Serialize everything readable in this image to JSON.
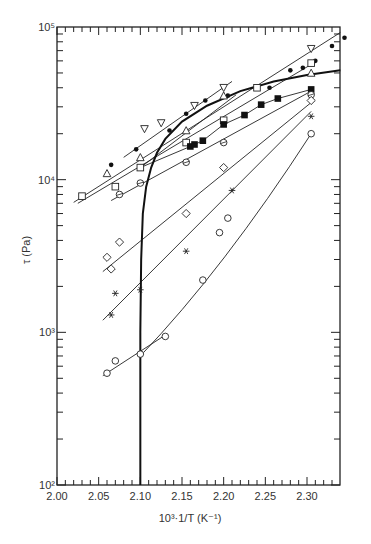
{
  "chart_data": {
    "type": "scatter",
    "title": "",
    "xlabel": "10³·1/T (K⁻¹)",
    "ylabel": "τ (Pa)",
    "xscale": "linear",
    "yscale": "log",
    "xlim": [
      2.0,
      2.34
    ],
    "ylim": [
      100,
      100000
    ],
    "grid": false,
    "legend": null,
    "x_ticks": [
      2.0,
      2.05,
      2.1,
      2.15,
      2.2,
      2.25,
      2.3
    ],
    "x_tick_labels": [
      "2.00",
      "2.05",
      "2.10",
      "2.15",
      "2.20",
      "2.25",
      "2.30"
    ],
    "y_ticks": [
      100,
      1000,
      10000,
      100000
    ],
    "y_tick_labels": [
      "10²",
      "10³",
      "10⁴",
      "10⁵"
    ],
    "envelope_curve": {
      "name": "bold boundary curve",
      "x": [
        2.1,
        2.1,
        2.101,
        2.103,
        2.107,
        2.113,
        2.12,
        2.13,
        2.15,
        2.18,
        2.22,
        2.26,
        2.3,
        2.34
      ],
      "y": [
        100,
        1000,
        3000,
        6000,
        9000,
        12000,
        15000,
        18500,
        24000,
        30500,
        38000,
        44000,
        48500,
        52000
      ]
    },
    "series": [
      {
        "name": "filled circle",
        "marker": "dot",
        "line": [
          [
            2.02,
            7100
          ],
          [
            2.34,
            92000
          ]
        ],
        "x": [
          2.065,
          2.095,
          2.135,
          2.155,
          2.178,
          2.205,
          2.255,
          2.28,
          2.295,
          2.31,
          2.33,
          2.345
        ],
        "y": [
          12500,
          15800,
          21000,
          27000,
          33000,
          35500,
          40000,
          52000,
          54000,
          60000,
          75000,
          85000
        ]
      },
      {
        "name": "inverted triangle",
        "marker": "tri-down",
        "line": [
          [
            2.08,
            14000
          ],
          [
            2.21,
            44000
          ]
        ],
        "x": [
          2.105,
          2.125,
          2.165,
          2.2,
          2.305
        ],
        "y": [
          21500,
          23500,
          30500,
          40000,
          72000
        ]
      },
      {
        "name": "open triangle",
        "marker": "tri-up",
        "line": [
          [
            2.1,
            12000
          ],
          [
            2.215,
            36000
          ]
        ],
        "x": [
          2.06,
          2.1,
          2.155,
          2.2,
          2.305
        ],
        "y": [
          11000,
          14000,
          21000,
          35500,
          50000
        ]
      },
      {
        "name": "open square",
        "marker": "square",
        "line": [
          [
            2.025,
            7000
          ],
          [
            2.31,
            59000
          ]
        ],
        "x": [
          2.03,
          2.07,
          2.1,
          2.155,
          2.2,
          2.24,
          2.305
        ],
        "y": [
          7800,
          9000,
          12000,
          17500,
          24500,
          40000,
          58000
        ]
      },
      {
        "name": "filled square",
        "marker": "filled-square",
        "line": null,
        "x": [
          2.16,
          2.165,
          2.175,
          2.2,
          2.225,
          2.245,
          2.265,
          2.305
        ],
        "y": [
          16500,
          17000,
          18000,
          23000,
          26500,
          31000,
          34000,
          39000
        ]
      },
      {
        "name": "circle with slash",
        "marker": "circle-slash",
        "line": [
          [
            2.065,
            7300
          ],
          [
            2.305,
            38000
          ]
        ],
        "x": [
          2.075,
          2.1,
          2.155,
          2.2,
          2.305
        ],
        "y": [
          8000,
          9500,
          13000,
          17500,
          36000
        ]
      },
      {
        "name": "open diamond",
        "marker": "diamond",
        "line": [
          [
            2.055,
            2500
          ],
          [
            2.305,
            32000
          ]
        ],
        "x": [
          2.06,
          2.065,
          2.075,
          2.155,
          2.2,
          2.305
        ],
        "y": [
          3100,
          2600,
          3900,
          6000,
          12000,
          33000
        ]
      },
      {
        "name": "asterisk",
        "marker": "asterisk",
        "line": [
          [
            2.055,
            1200
          ],
          [
            2.305,
            28000
          ]
        ],
        "x": [
          2.065,
          2.07,
          2.1,
          2.155,
          2.21,
          2.305
        ],
        "y": [
          1300,
          1800,
          1900,
          3400,
          8500,
          26000
        ]
      },
      {
        "name": "open circle",
        "marker": "circle",
        "line": [
          [
            2.055,
            520
          ],
          [
            2.13,
            960
          ]
        ],
        "x": [
          2.06,
          2.07,
          2.1,
          2.13,
          2.175,
          2.195,
          2.205,
          2.305
        ],
        "y": [
          540,
          650,
          720,
          940,
          2200,
          4500,
          5600,
          20000
        ]
      },
      {
        "name": "open circle curve",
        "marker": "none",
        "line": [
          [
            2.1,
            700
          ],
          [
            2.305,
            20000
          ]
        ],
        "x": [],
        "y": []
      }
    ]
  }
}
